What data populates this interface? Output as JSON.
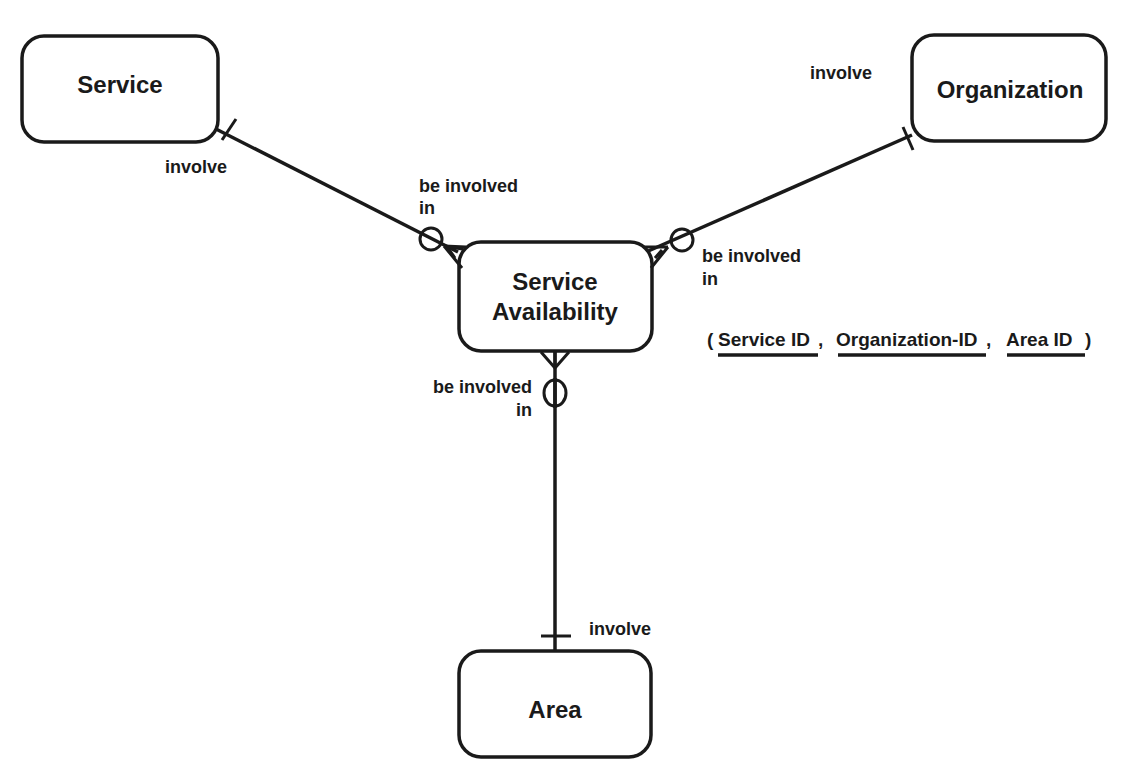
{
  "diagram": {
    "type": "entity-relationship",
    "notation": "crow's foot",
    "entities": [
      {
        "id": "service",
        "label": "Service"
      },
      {
        "id": "organization",
        "label": "Organization"
      },
      {
        "id": "service_availability",
        "label_line1": "Service",
        "label_line2": "Availability"
      },
      {
        "id": "area",
        "label": "Area"
      }
    ],
    "relationships": [
      {
        "from": "Service",
        "to": "Service Availability",
        "from_label": "involve",
        "to_label_line1": "be involved",
        "to_label_line2": "in",
        "from_cardinality": "one",
        "to_cardinality": "zero-or-many"
      },
      {
        "from": "Organization",
        "to": "Service Availability",
        "from_label": "involve",
        "to_label_line1": "be involved",
        "to_label_line2": "in",
        "from_cardinality": "one",
        "to_cardinality": "zero-or-many"
      },
      {
        "from": "Area",
        "to": "Service Availability",
        "from_label": "involve",
        "to_label_line1": "be involved",
        "to_label_line2": "in",
        "from_cardinality": "one",
        "to_cardinality": "zero-or-many"
      }
    ],
    "key": {
      "open": "(",
      "parts": [
        "Service ID",
        "Organization-ID",
        "Area ID"
      ],
      "separator": ",",
      "close": ")"
    }
  }
}
